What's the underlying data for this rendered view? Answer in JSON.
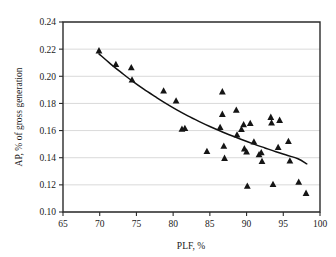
{
  "chart_data": {
    "type": "scatter",
    "title": "",
    "subtitle": "",
    "xlabel": "PLF, %",
    "ylabel": "AP, % of gross generation",
    "xlim": [
      65,
      100
    ],
    "ylim": [
      0.1,
      0.24
    ],
    "xticks": [
      65,
      70,
      75,
      80,
      85,
      90,
      95,
      100
    ],
    "xtick_labels": [
      "65",
      "70",
      "75",
      "80",
      "85",
      "90",
      "95",
      "100"
    ],
    "yticks": [
      0.1,
      0.12,
      0.14,
      0.16,
      0.18,
      0.2,
      0.22,
      0.24
    ],
    "ytick_labels": [
      "0.10",
      "0.12",
      "0.14",
      "0.16",
      "0.18",
      "0.20",
      "0.22",
      "0.24"
    ],
    "grid": "horizontal",
    "legend": "none",
    "marker": "triangle",
    "marker_color": "#151515",
    "curve_color": "#111111",
    "grid_color": "#c8c8c8",
    "frame_color": "#2b2b2b",
    "series": [
      {
        "name": "Observations",
        "marker": "triangle",
        "points": [
          [
            69.9,
            0.219
          ],
          [
            72.2,
            0.209
          ],
          [
            74.3,
            0.2065
          ],
          [
            74.4,
            0.1975
          ],
          [
            78.7,
            0.1895
          ],
          [
            80.4,
            0.182
          ],
          [
            81.2,
            0.1612
          ],
          [
            81.6,
            0.1618
          ],
          [
            84.6,
            0.1448
          ],
          [
            86.4,
            0.1625
          ],
          [
            86.7,
            0.1888
          ],
          [
            86.7,
            0.1722
          ],
          [
            86.9,
            0.1487
          ],
          [
            87.0,
            0.1398
          ],
          [
            88.6,
            0.1752
          ],
          [
            88.7,
            0.157
          ],
          [
            89.3,
            0.161
          ],
          [
            89.6,
            0.1645
          ],
          [
            89.7,
            0.1468
          ],
          [
            90.0,
            0.1445
          ],
          [
            90.1,
            0.1192
          ],
          [
            90.5,
            0.1655
          ],
          [
            91.0,
            0.1518
          ],
          [
            91.7,
            0.1425
          ],
          [
            92.0,
            0.144
          ],
          [
            92.1,
            0.1375
          ],
          [
            93.3,
            0.17
          ],
          [
            93.4,
            0.1658
          ],
          [
            93.6,
            0.1205
          ],
          [
            94.3,
            0.1478
          ],
          [
            94.5,
            0.1678
          ],
          [
            95.7,
            0.1522
          ],
          [
            95.9,
            0.1378
          ],
          [
            97.1,
            0.1222
          ],
          [
            98.1,
            0.114
          ]
        ]
      }
    ],
    "trend": {
      "name": "Fitted trend",
      "type": "curve",
      "points": [
        [
          69.9,
          0.2165
        ],
        [
          71.5,
          0.209
        ],
        [
          73.0,
          0.2025
        ],
        [
          74.5,
          0.1962
        ],
        [
          76.0,
          0.1905
        ],
        [
          77.5,
          0.1852
        ],
        [
          79.0,
          0.18
        ],
        [
          80.5,
          0.1752
        ],
        [
          82.0,
          0.1708
        ],
        [
          83.5,
          0.1668
        ],
        [
          85.0,
          0.163
        ],
        [
          86.5,
          0.1595
        ],
        [
          88.0,
          0.1562
        ],
        [
          89.5,
          0.153
        ],
        [
          91.0,
          0.15
        ],
        [
          92.5,
          0.1472
        ],
        [
          94.0,
          0.1444
        ],
        [
          95.5,
          0.1418
        ],
        [
          97.0,
          0.1392
        ],
        [
          98.2,
          0.1355
        ]
      ]
    }
  }
}
